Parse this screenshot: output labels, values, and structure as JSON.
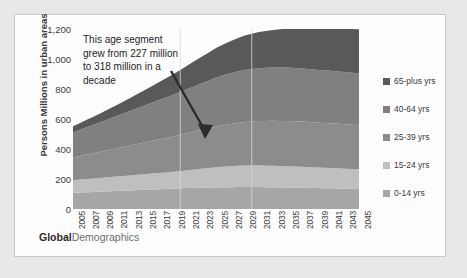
{
  "page": {
    "top_artifact_text": "· · · ·  · ·· ·",
    "background": "#e8e8e6",
    "card_background": "#fdfdfd",
    "card_border": "#c9c9c7"
  },
  "footer": {
    "brand_first": "Global",
    "brand_second": "Demographics"
  },
  "annotation": {
    "text": "This age segment grew from 227 million to 318 million in a decade",
    "arrow_name": "annotation-arrow"
  },
  "legend": {
    "position": "right",
    "items": [
      {
        "label": "65-plus yrs",
        "color": "#595959"
      },
      {
        "label": "40-64 yrs",
        "color": "#808080"
      },
      {
        "label": "25-39 yrs",
        "color": "#8c8c8c"
      },
      {
        "label": "15-24 yrs",
        "color": "#bfbfbf"
      },
      {
        "label": "0-14 yrs",
        "color": "#a6a6a6"
      }
    ]
  },
  "chart_data": {
    "type": "area",
    "stacked": true,
    "title": "",
    "xlabel": "",
    "ylabel": "Persons Millions in urban areas",
    "ylim": [
      0,
      1200
    ],
    "yticks": [
      0,
      200,
      400,
      600,
      800,
      1000,
      1200
    ],
    "ytick_labels": [
      "0",
      "200",
      "400",
      "600",
      "800",
      "1,000",
      "1,200"
    ],
    "grid": "vertical-only",
    "gridline_years": [
      2020,
      2030
    ],
    "x": [
      2005,
      2006,
      2007,
      2008,
      2009,
      2010,
      2011,
      2012,
      2013,
      2014,
      2015,
      2016,
      2017,
      2018,
      2019,
      2020,
      2021,
      2022,
      2023,
      2024,
      2025,
      2026,
      2027,
      2028,
      2029,
      2030,
      2031,
      2032,
      2033,
      2034,
      2035,
      2036,
      2037,
      2038,
      2039,
      2040,
      2041,
      2042,
      2043,
      2044,
      2045
    ],
    "xtick_labels": [
      "2005",
      "2007",
      "2009",
      "2011",
      "2013",
      "2015",
      "2017",
      "2019",
      "2021",
      "2023",
      "2025",
      "2027",
      "2029",
      "2031",
      "2033",
      "2035",
      "2037",
      "2039",
      "2041",
      "2043",
      "2045"
    ],
    "series": [
      {
        "name": "0-14 yrs",
        "color": "#a6a6a6",
        "values": [
          108,
          110,
          112,
          114,
          116,
          118,
          120,
          122,
          124,
          126,
          128,
          130,
          132,
          134,
          136,
          138,
          140,
          141,
          142,
          143,
          144,
          145,
          145,
          146,
          146,
          146,
          146,
          145,
          145,
          144,
          144,
          143,
          142,
          141,
          140,
          139,
          138,
          137,
          136,
          135,
          134
        ]
      },
      {
        "name": "15-24 yrs",
        "color": "#bfbfbf",
        "values": [
          84,
          86,
          88,
          90,
          92,
          94,
          96,
          98,
          100,
          102,
          104,
          106,
          108,
          110,
          112,
          114,
          118,
          122,
          126,
          130,
          134,
          137,
          140,
          142,
          144,
          145,
          145,
          144,
          143,
          142,
          141,
          140,
          139,
          138,
          137,
          136,
          135,
          134,
          133,
          132,
          131
        ]
      },
      {
        "name": "25-39 yrs",
        "color": "#8c8c8c",
        "values": [
          152,
          158,
          164,
          170,
          176,
          182,
          188,
          194,
          200,
          206,
          212,
          218,
          224,
          230,
          236,
          242,
          248,
          254,
          260,
          266,
          272,
          277,
          282,
          286,
          290,
          293,
          296,
          298,
          300,
          301,
          302,
          302,
          302,
          301,
          300,
          299,
          298,
          297,
          296,
          295,
          294
        ]
      },
      {
        "name": "40-64 yrs",
        "color": "#808080",
        "values": [
          166,
          174,
          182,
          190,
          198,
          206,
          214,
          222,
          230,
          238,
          246,
          254,
          262,
          270,
          278,
          286,
          294,
          302,
          310,
          318,
          326,
          332,
          338,
          343,
          347,
          350,
          352,
          354,
          355,
          356,
          356,
          355,
          354,
          353,
          352,
          351,
          350,
          349,
          348,
          347,
          346
        ]
      },
      {
        "name": "65-plus yrs",
        "color": "#595959",
        "values": [
          42,
          46,
          50,
          55,
          60,
          66,
          72,
          79,
          86,
          94,
          102,
          110,
          119,
          128,
          137,
          147,
          157,
          167,
          177,
          187,
          197,
          206,
          214,
          222,
          229,
          235,
          241,
          246,
          251,
          256,
          260,
          264,
          268,
          272,
          276,
          279,
          282,
          285,
          288,
          291,
          294
        ]
      }
    ],
    "annotation_values": {
      "from": 227,
      "to": 318,
      "unit": "million",
      "period": "decade"
    }
  }
}
